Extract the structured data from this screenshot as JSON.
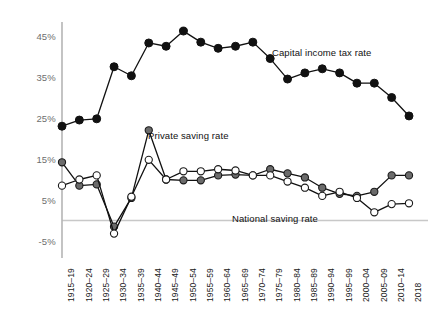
{
  "chart_data": {
    "type": "line",
    "title": "",
    "subtitle": "",
    "xlabel": "",
    "ylabel": "",
    "ylim": [
      -5,
      50
    ],
    "yticks": [
      -5,
      5,
      15,
      25,
      35,
      45
    ],
    "ytick_labels": [
      "-5%",
      "5%",
      "15%",
      "25%",
      "35%",
      "45%"
    ],
    "grid": "horizontal-zero-line-only",
    "legend_position": "inline-annotations",
    "categories": [
      "1915–19",
      "1920–24",
      "1925–29",
      "1930–34",
      "1935–39",
      "1940–44",
      "1945–49",
      "1950–54",
      "1955–59",
      "1960–64",
      "1965–69",
      "1970–74",
      "1975–79",
      "1980–84",
      "1985–89",
      "1990–94",
      "1995–99",
      "2000–04",
      "2005–09",
      "2010–14",
      "2018"
    ],
    "series": [
      {
        "name": "Capital income tax rate",
        "marker": "filled-black-circle",
        "color": "#111111",
        "values": [
          23.0,
          24.5,
          24.8,
          37.5,
          35.3,
          43.3,
          42.5,
          46.2,
          43.5,
          42.0,
          42.5,
          43.5,
          39.5,
          34.5,
          36.0,
          37.0,
          36.0,
          33.5,
          33.5,
          30.0,
          25.5
        ]
      },
      {
        "name": "Private saving rate",
        "marker": "filled-gray-circle",
        "color": "#6b6b6b",
        "values": [
          14.2,
          8.5,
          8.8,
          -1.5,
          5.5,
          22.0,
          10.0,
          9.8,
          9.8,
          11.0,
          11.2,
          11.0,
          12.5,
          11.5,
          10.5,
          8.0,
          6.5,
          6.0,
          7.0,
          11.0,
          11.0
        ]
      },
      {
        "name": "National saving rate",
        "marker": "open-white-circle",
        "color": "#111111",
        "values": [
          8.5,
          10.0,
          11.0,
          -3.2,
          5.8,
          14.8,
          10.0,
          12.0,
          12.0,
          12.5,
          12.2,
          11.0,
          11.0,
          9.5,
          8.0,
          6.0,
          7.0,
          5.5,
          2.0,
          4.0,
          4.2
        ]
      }
    ],
    "annotations": [
      {
        "text": "Capital income tax rate",
        "x_px": 272,
        "y_px": 47
      },
      {
        "text": "Private saving rate",
        "x_px": 148,
        "y_px": 130
      },
      {
        "text": "National saving rate",
        "x_px": 232,
        "y_px": 213
      }
    ],
    "colors": {
      "axis": "#b5b5b5",
      "zero_line": "#c8c8c8",
      "tax_line": "#111111",
      "private_marker_fill": "#6b6b6b",
      "national_marker_fill": "#ffffff",
      "tick_text": "#6e6e6e",
      "background": "#ffffff"
    }
  }
}
